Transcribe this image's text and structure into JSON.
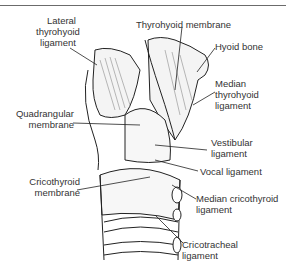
{
  "figure": {
    "labels": {
      "lateral_thyrohyoid": "Lateral\nthyrohyoid\nligament",
      "thyrohyoid_membrane": "Thyrohyoid membrane",
      "hyoid_bone": "Hyoid bone",
      "median_thyrohyoid": "Median\nthyrohyoid\nligament",
      "quadrangular": "Quadrangular\nmembrane",
      "vestibular": "Vestibular\nligament",
      "vocal": "Vocal ligament",
      "cricothyroid_membrane": "Cricothyroid\nmembrane",
      "median_cricothyroid": "Median cricothyroid\nligament",
      "cricotracheal": "Cricotracheal\nligament"
    }
  }
}
